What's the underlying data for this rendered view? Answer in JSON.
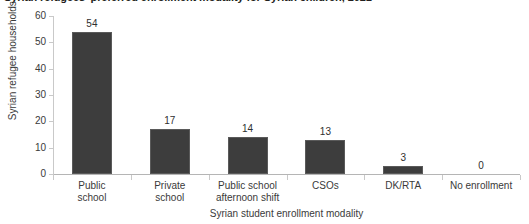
{
  "chart_data": {
    "type": "bar",
    "title": "Syrian refugees' preferred enrollment modality for Syrian children, 2021",
    "xlabel": "Syrian student enrollment modality",
    "ylabel": "Syrian refugee households (%)",
    "categories": [
      "Public school",
      "Private school",
      "Public school afternoon shift",
      "CSOs",
      "DK/RTA",
      "No enrollment"
    ],
    "category_lines": [
      [
        "Public",
        "school"
      ],
      [
        "Private",
        "school"
      ],
      [
        "Public school",
        "afternoon shift"
      ],
      [
        "CSOs",
        ""
      ],
      [
        "DK/RTA",
        ""
      ],
      [
        "No enrollment",
        ""
      ]
    ],
    "values": [
      54,
      17,
      14,
      13,
      3,
      0
    ],
    "value_labels": [
      "54",
      "17",
      "14",
      "13",
      "3",
      "0"
    ],
    "ylim": [
      0,
      60
    ],
    "yticks": [
      0,
      10,
      20,
      30,
      40,
      50,
      60
    ],
    "ytick_labels": [
      "0",
      "10",
      "20",
      "30",
      "40",
      "50",
      "60"
    ],
    "grid": false,
    "legend": "none",
    "bar_color": "#3d3d3d",
    "axis_color": "#c9c9c9",
    "text_color": "#3a3a3a"
  }
}
